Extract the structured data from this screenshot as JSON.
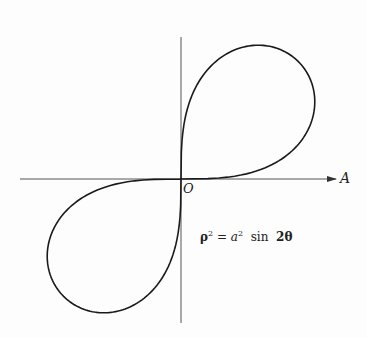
{
  "diagram": {
    "equation": {
      "lhs_symbol": "ρ",
      "lhs_exp": "2",
      "equals": "=",
      "coef_symbol": "a",
      "coef_exp": "2",
      "func": "sin",
      "arg": "2θ"
    },
    "labels": {
      "origin": "O",
      "polar_axis": "A"
    },
    "geometry": {
      "origin_px": [
        181,
        179
      ],
      "a_px": 166,
      "h_axis": {
        "x1": 20,
        "x2": 336,
        "y": 179
      },
      "v_axis": {
        "x": 181,
        "y1": 37,
        "y2": 323
      }
    },
    "colors": {
      "curve": "#1a1a1a",
      "axis": "#444444",
      "background": "#fdfdfd"
    }
  }
}
